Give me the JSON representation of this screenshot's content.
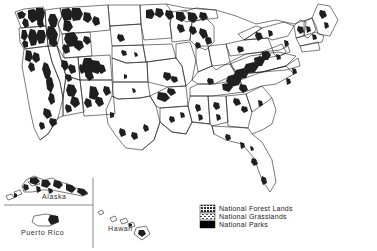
{
  "map": {
    "title": "National Forest Lands, National Grasslands and National Parks of the United States",
    "region": "United States",
    "outline_color": "#1a1a1a",
    "background_color": "#ffffff"
  },
  "insets": [
    {
      "name": "alaska-inset",
      "label": "Alaska"
    },
    {
      "name": "puerto-rico-inset",
      "label": "Puerto Rico"
    },
    {
      "name": "hawaii-inset",
      "label": "Hawaii"
    }
  ],
  "legend": {
    "name": "map-legend",
    "items": [
      {
        "label": "National Forest Lands",
        "swatch": "#6e6e6e",
        "pattern": "dense-stipple"
      },
      {
        "label": "National Grasslands",
        "swatch": "#8c8c8c",
        "pattern": "light-stipple"
      },
      {
        "label": "National Parks",
        "swatch": "#000000",
        "pattern": "solid"
      }
    ]
  }
}
